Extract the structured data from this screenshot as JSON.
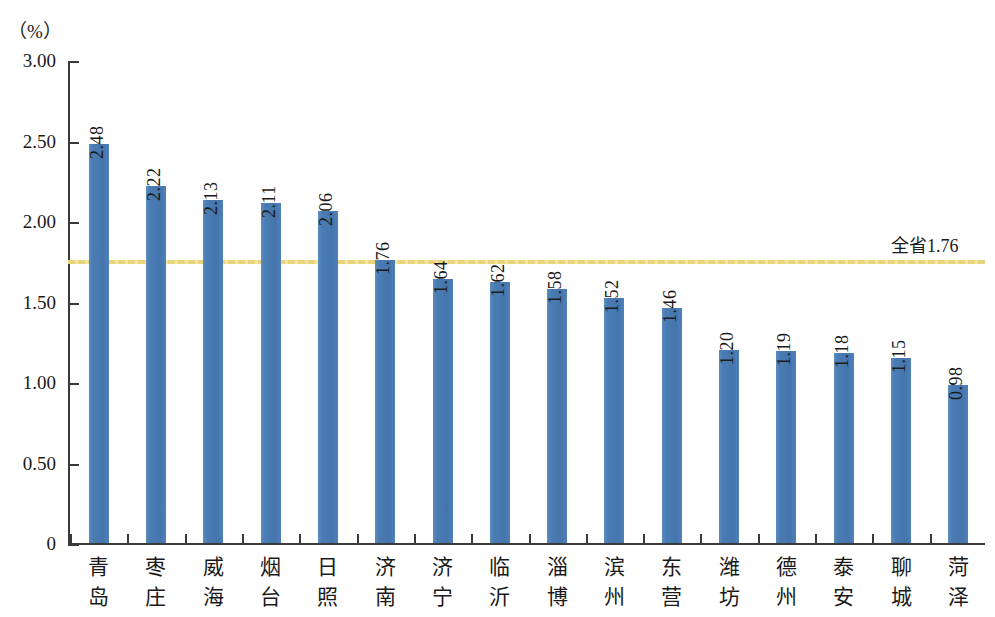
{
  "chart_data": {
    "type": "bar",
    "title": "",
    "subtitle": "",
    "unit_label": "（%）",
    "xlabel": "",
    "ylabel": "",
    "ylim": [
      0,
      3.0
    ],
    "ytick_labels": [
      "3.00",
      "2.50",
      "2.00",
      "1.50",
      "1.00",
      "0.50",
      "0"
    ],
    "ytick_values": [
      3.0,
      2.5,
      2.0,
      1.5,
      1.0,
      0.5,
      0
    ],
    "grid": false,
    "legend": "none",
    "bar_color": "#4a7cb3",
    "reference_line": {
      "value": 1.76,
      "label": "全省1.76",
      "color": "#e8d47a",
      "style": "dotted"
    },
    "categories": [
      "青岛",
      "枣庄",
      "威海",
      "烟台",
      "日照",
      "济南",
      "济宁",
      "临沂",
      "淄博",
      "滨州",
      "东营",
      "潍坊",
      "德州",
      "泰安",
      "聊城",
      "菏泽"
    ],
    "values": [
      2.48,
      2.22,
      2.13,
      2.11,
      2.06,
      1.76,
      1.64,
      1.62,
      1.58,
      1.52,
      1.46,
      1.2,
      1.19,
      1.18,
      1.15,
      0.98
    ],
    "value_labels": [
      "2.48",
      "2.22",
      "2.13",
      "2.11",
      "2.06",
      "1.76",
      "1.64",
      "1.62",
      "1.58",
      "1.52",
      "1.46",
      "1.20",
      "1.19",
      "1.18",
      "1.15",
      "0.98"
    ]
  }
}
